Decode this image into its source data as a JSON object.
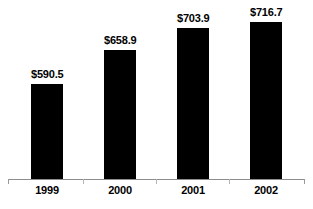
{
  "chart_data": {
    "type": "bar",
    "title": "",
    "subtitle": "",
    "xlabel": "",
    "ylabel": "",
    "categories": [
      "1999",
      "2000",
      "2001",
      "2002"
    ],
    "values": [
      590.5,
      658.9,
      703.9,
      716.7
    ],
    "data_labels": [
      "$590.5",
      "$658.9",
      "$703.9",
      "$716.7"
    ],
    "ylim": [
      400,
      760
    ],
    "grid": false,
    "legend": false,
    "legend_position": "none",
    "axis_visible": true,
    "bar_color": "#000000",
    "axis_color": "#8d8d8d",
    "tick_color": "#b4b4b4",
    "label_color": "#000000",
    "background_color": "#ffffff"
  },
  "layout": {
    "plot_left": 8,
    "plot_right": 305,
    "baseline_y": 179,
    "bar_width": 32,
    "bar_starts": [
      31,
      104,
      177,
      250
    ],
    "tick_positions": [
      8,
      83,
      156,
      229,
      304
    ]
  }
}
